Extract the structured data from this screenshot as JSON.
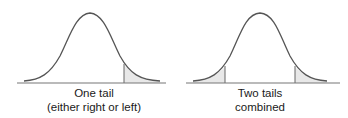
{
  "diagrams": [
    {
      "id": "one-tail",
      "caption_line1": "One tail",
      "caption_line2": "(either right or left)",
      "shaded_regions": [
        "right-tail"
      ]
    },
    {
      "id": "two-tails",
      "caption_line1": "Two tails",
      "caption_line2": "combined",
      "shaded_regions": [
        "left-tail",
        "right-tail"
      ]
    }
  ],
  "colors": {
    "curve": "#555555",
    "baseline": "#777777",
    "shade": "#e8e8e8",
    "text": "#1a1a1a"
  }
}
